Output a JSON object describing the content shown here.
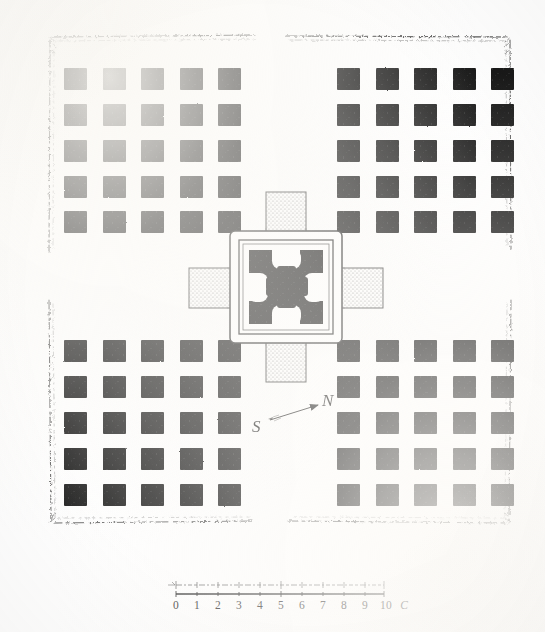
{
  "plate": {
    "title": "Plan of a hypostyle temple with central cruciform sanctuary",
    "medium": "engraved architectural ground plan",
    "paper_color": "#fefefe",
    "ink_color": "#111111"
  },
  "enclosure": {
    "name": "enclosure-wall",
    "style": "hand-drawn broken hatched line",
    "bounds": {
      "x": 48,
      "y": 34,
      "width": 464,
      "height": 492
    }
  },
  "colonnade": {
    "description": "Four quadrants of square columns surrounding the central sanctuary",
    "rows_per_quadrant": 5,
    "cols_per_quadrant": 5,
    "columns_per_quadrant": 25,
    "total_columns": 100,
    "pier_size": 22,
    "pier_fill": "#131313",
    "quadrants": [
      {
        "name": "top-left",
        "x_start": 64,
        "y_start": 68,
        "x_step": 38.5,
        "y_step": 36
      },
      {
        "name": "top-right",
        "x_start": 337,
        "y_start": 68,
        "x_step": 38.5,
        "y_step": 36
      },
      {
        "name": "bottom-left",
        "x_start": 64,
        "y_start": 340,
        "x_step": 38.5,
        "y_step": 36
      },
      {
        "name": "bottom-right",
        "x_start": 337,
        "y_start": 340,
        "x_step": 38.5,
        "y_step": 36
      }
    ]
  },
  "sanctuary": {
    "name": "central-cruciform-sanctuary",
    "outer_frame": {
      "x": 231,
      "y": 232,
      "width": 110,
      "height": 110
    },
    "inner_frame": {
      "x": 240,
      "y": 241,
      "width": 92,
      "height": 92
    },
    "core": {
      "x": 249,
      "y": 250,
      "width": 74,
      "height": 74,
      "fill": "#141414"
    },
    "porches": [
      {
        "name": "north-porch",
        "x": 266,
        "y": 192,
        "width": 40,
        "height": 42,
        "fill": "stipple"
      },
      {
        "name": "south-porch",
        "x": 266,
        "y": 340,
        "width": 40,
        "height": 42,
        "fill": "stipple"
      },
      {
        "name": "west-porch",
        "x": 190,
        "y": 268,
        "width": 43,
        "height": 40,
        "fill": "stipple"
      },
      {
        "name": "east-porch",
        "x": 339,
        "y": 268,
        "width": 43,
        "height": 40,
        "fill": "stipple"
      }
    ],
    "core_voids": 5,
    "void_description": "four rounded white recesses at edge midpoints plus central white cross"
  },
  "compass": {
    "name": "compass-direction-indicator",
    "south_label": "S",
    "north_label": "N",
    "arrow_from": {
      "x": 262,
      "y": 424
    },
    "arrow_to": {
      "x": 324,
      "y": 404
    },
    "orientation_note": "arrow points from S toward N, up and to the right"
  },
  "scale_bar": {
    "name": "graphic-scale",
    "unit_label": "C",
    "ticks": [
      "0",
      "1",
      "2",
      "3",
      "4",
      "5",
      "6",
      "7",
      "8",
      "9",
      "10"
    ],
    "bar": {
      "x": 176,
      "y": 589,
      "width": 208,
      "height": 7
    },
    "divisions": 10,
    "subdivision_note": "upper register finely subdivided, lower register gives whole units"
  }
}
